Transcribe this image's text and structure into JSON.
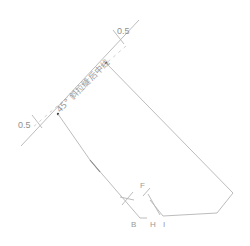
{
  "diagram": {
    "type": "pattern-drafting",
    "colors": {
      "line": "#b4b4b4",
      "text": "#8f8f8f",
      "point": "#444444",
      "background": "#ffffff"
    },
    "labels": {
      "center_line": "45° 斜拉缝后中线",
      "offset_top": "0.5",
      "offset_left": "0.5",
      "point_b": "B",
      "point_h": "H",
      "point_i": "I",
      "point_f": "F"
    }
  }
}
